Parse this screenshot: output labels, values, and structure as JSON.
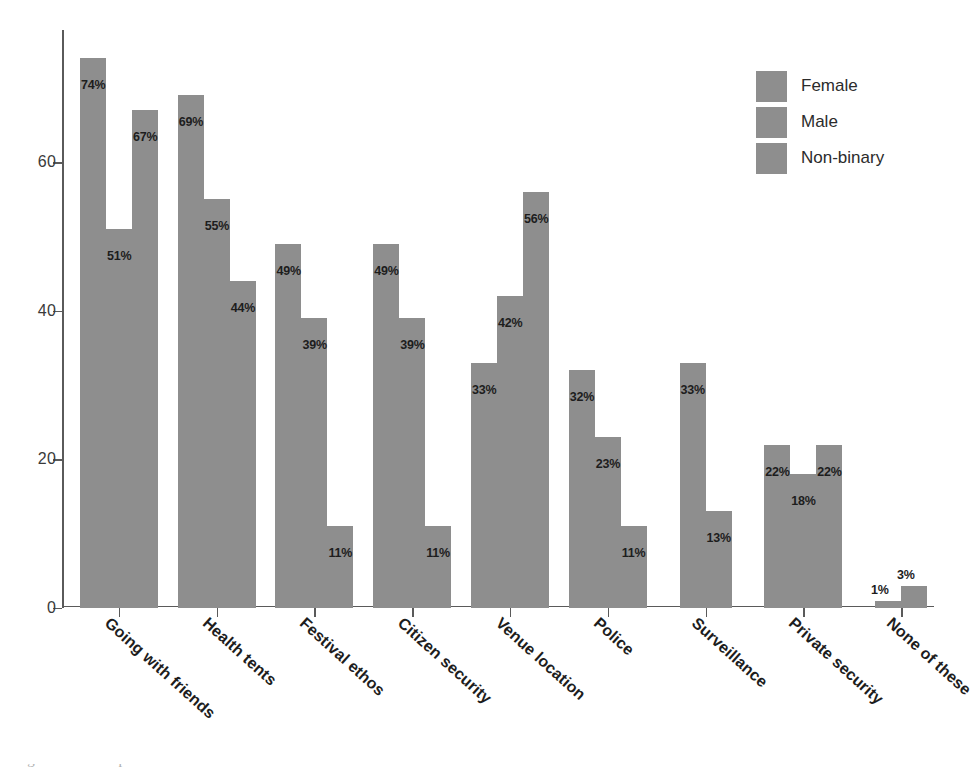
{
  "chart_data": {
    "type": "bar",
    "title": "",
    "subtitle": "",
    "xlabel": "",
    "ylabel": "",
    "ylim": [
      0,
      77.8
    ],
    "yticks": [
      0,
      20,
      40,
      60
    ],
    "ytick_labels": [
      "0",
      "20",
      "40",
      "60"
    ],
    "grid": false,
    "legend_position": "top-right",
    "value_suffix": "%",
    "categories": [
      "Going with friends",
      "Health tents",
      "Festival ethos",
      "Citizen security",
      "Venue location",
      "Police",
      "Surveillance",
      "Private security",
      "None of these"
    ],
    "series": [
      {
        "name": "Female",
        "color": "#8e8e8e",
        "values": [
          74,
          69,
          49,
          49,
          33,
          32,
          33,
          22,
          1
        ],
        "labels": [
          "74%",
          "69%",
          "49%",
          "49%",
          "33%",
          "32%",
          "33%",
          "22%",
          "1%"
        ]
      },
      {
        "name": "Male",
        "color": "#8e8e8e",
        "values": [
          51,
          55,
          39,
          39,
          42,
          23,
          13,
          18,
          3
        ],
        "labels": [
          "51%",
          "55%",
          "39%",
          "39%",
          "42%",
          "23%",
          "13%",
          "18%",
          "3%"
        ]
      },
      {
        "name": "Non-binary",
        "color": "#8e8e8e",
        "values": [
          67,
          44,
          11,
          11,
          56,
          11,
          null,
          22,
          null
        ],
        "labels": [
          "67%",
          "44%",
          "11%",
          "11%",
          "56%",
          "11%",
          "",
          "22%",
          ""
        ]
      }
    ]
  },
  "legend": {
    "items": [
      {
        "label": "Female",
        "swatch": "legend-swatch-female"
      },
      {
        "label": "Male",
        "swatch": "legend-swatch-male"
      },
      {
        "label": "Non-binary",
        "swatch": "legend-swatch-non-binary"
      }
    ]
  },
  "caption": {
    "cut_off_line": "illegible cut-off caption line"
  }
}
